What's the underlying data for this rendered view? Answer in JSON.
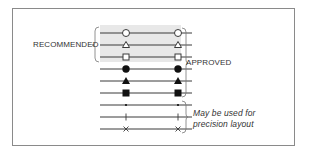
{
  "labels": {
    "recommended": "RECOMMENDED",
    "approved": "APPROVED",
    "precision_line1": "May be used for",
    "precision_line2": "precision layout"
  },
  "rows": [
    {
      "marker": "open-circle",
      "group": "recommended"
    },
    {
      "marker": "open-triangle",
      "group": "recommended"
    },
    {
      "marker": "open-square",
      "group": "recommended"
    },
    {
      "marker": "filled-circle",
      "group": "approved"
    },
    {
      "marker": "filled-triangle",
      "group": "approved"
    },
    {
      "marker": "filled-square",
      "group": "approved"
    },
    {
      "marker": "dot",
      "group": "precision"
    },
    {
      "marker": "plus",
      "group": "precision"
    },
    {
      "marker": "x-cross",
      "group": "precision"
    }
  ],
  "colors": {
    "line": "#3a3a3a",
    "shade": "#e8e8e8",
    "border": "#8a8a8a",
    "text": "#333333"
  }
}
